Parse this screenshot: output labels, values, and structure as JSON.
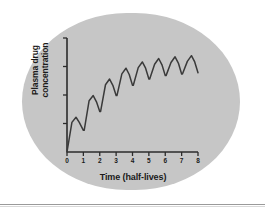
{
  "figure": {
    "background_color": "#ffffff",
    "oval_color": "#c6c6c6",
    "line_color": "#3a3a3a",
    "axis_color": "#2b2b2b",
    "text_color": "#1a1a1a"
  },
  "chart_data": {
    "type": "line",
    "title": "",
    "subtitle": "",
    "xlabel": "Time (half-lives)",
    "ylabel": "Plasma drug concentration",
    "ylabel_line1": "Plasma drug",
    "ylabel_line2": "concentration",
    "xlim": [
      0,
      8
    ],
    "ylim": [
      0,
      10
    ],
    "xticks": [
      0,
      1,
      2,
      3,
      4,
      5,
      6,
      7,
      8
    ],
    "xtick_labels": [
      "0",
      "1",
      "2",
      "3",
      "4",
      "5",
      "6",
      "7",
      "8"
    ],
    "yticks": [
      0,
      2.5,
      5,
      7.5,
      10
    ],
    "ytick_labels": [
      "",
      "",
      "",
      "",
      ""
    ],
    "grid": false,
    "legend": false,
    "legend_position": "none",
    "annotation": "Sawtooth accumulation of plasma drug concentration with repeated dosing approaching steady state over 8 half-lives",
    "series": [
      {
        "name": "Plasma drug concentration",
        "color": "#3a3a3a",
        "x": [
          0.0,
          0.3,
          0.55,
          0.75,
          1.0,
          1.05,
          1.35,
          1.6,
          1.8,
          2.0,
          2.05,
          2.35,
          2.6,
          2.8,
          3.0,
          3.05,
          3.35,
          3.6,
          3.8,
          4.0,
          4.05,
          4.35,
          4.6,
          4.8,
          5.0,
          5.05,
          5.35,
          5.6,
          5.8,
          6.0,
          6.05,
          6.35,
          6.6,
          6.8,
          7.0,
          7.05,
          7.35,
          7.6,
          7.8,
          8.0
        ],
        "y": [
          0.0,
          2.6,
          3.05,
          2.6,
          1.9,
          1.9,
          4.5,
          4.95,
          4.4,
          3.55,
          3.55,
          5.9,
          6.4,
          5.85,
          4.95,
          4.95,
          6.85,
          7.35,
          6.8,
          5.85,
          5.85,
          7.4,
          7.9,
          7.35,
          6.4,
          6.4,
          7.7,
          8.2,
          7.65,
          6.7,
          6.7,
          7.85,
          8.35,
          7.8,
          6.85,
          6.85,
          7.95,
          8.45,
          7.9,
          6.95
        ]
      }
    ],
    "peaks": [
      3.05,
      4.95,
      6.4,
      7.35,
      7.9,
      8.2,
      8.35,
      8.45
    ],
    "troughs": [
      1.9,
      3.55,
      4.95,
      5.85,
      6.4,
      6.7,
      6.85,
      6.95
    ],
    "peak_times": [
      0.55,
      1.6,
      2.6,
      3.6,
      4.6,
      5.6,
      6.6,
      7.6
    ],
    "trough_times": [
      1.0,
      2.0,
      3.0,
      4.0,
      5.0,
      6.0,
      7.0,
      8.0
    ]
  }
}
